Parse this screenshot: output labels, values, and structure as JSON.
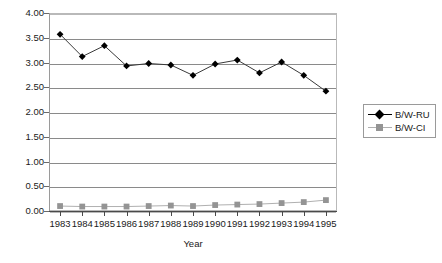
{
  "chart_data": {
    "type": "line",
    "title": "",
    "xlabel": "Year",
    "ylabel": "",
    "grid": true,
    "legend_position": "right",
    "categories": [
      1983,
      1984,
      1985,
      1986,
      1987,
      1988,
      1989,
      1990,
      1991,
      1992,
      1993,
      1994,
      1995
    ],
    "x_tick_labels": [
      "1983",
      "1984",
      "1985",
      "1986",
      "1987",
      "1988",
      "1989",
      "1990",
      "1991",
      "1992",
      "1993",
      "1994",
      "1995"
    ],
    "y_tick_labels": [
      "0.00",
      "0.50",
      "1.00",
      "1.50",
      "2.00",
      "2.50",
      "3.00",
      "3.50",
      "4.00"
    ],
    "y_tick_values": [
      0.0,
      0.5,
      1.0,
      1.5,
      2.0,
      2.5,
      3.0,
      3.5,
      4.0
    ],
    "ylim": [
      0.0,
      4.0
    ],
    "series": [
      {
        "name": "B/W-RU",
        "marker": "diamond",
        "color": "#000000",
        "values": [
          3.57,
          3.12,
          3.34,
          2.93,
          2.98,
          2.95,
          2.74,
          2.97,
          3.05,
          2.79,
          3.01,
          2.74,
          2.42
        ]
      },
      {
        "name": "B/W-CI",
        "marker": "square",
        "color": "#949494",
        "values": [
          0.1,
          0.09,
          0.09,
          0.09,
          0.1,
          0.11,
          0.1,
          0.12,
          0.13,
          0.14,
          0.16,
          0.18,
          0.22
        ]
      }
    ]
  },
  "legend": {
    "entries": [
      {
        "label": "B/W-RU",
        "marker": "diamond-marker-icon"
      },
      {
        "label": "B/W-CI",
        "marker": "square-marker-icon"
      }
    ]
  },
  "axes": {
    "x_title": "Year"
  }
}
